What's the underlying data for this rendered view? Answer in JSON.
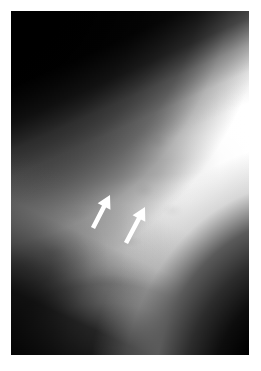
{
  "image": {
    "kind": "radiograph",
    "modality_label": "X-ray",
    "view_label": "Lateral chest radiograph",
    "caption": "",
    "border_color": "#ffffff",
    "plate": {
      "left": 11,
      "top": 11,
      "width": 238,
      "height": 344
    },
    "tones": {
      "background": "#ffffff",
      "air_black": "#000000",
      "soft_tissue_mid": "#9a9a9a",
      "overexposed_white": "#ffffff",
      "annotation": "#ffffff"
    },
    "regions": [
      {
        "name": "upper-left-air-field",
        "tone": "#000000",
        "description": "black wedge, upper left corner"
      },
      {
        "name": "right-overexposed-field",
        "tone": "#ffffff",
        "description": "bright white band along right side"
      },
      {
        "name": "mid-horizontal-band",
        "tone": "#4a4a4a",
        "description": "darker horizontal band across mid field"
      },
      {
        "name": "diaphragm-dome",
        "tone": "#e8e8e8",
        "description": "bright dome shaped structure, lower third"
      },
      {
        "name": "costophrenic-dark-pocket",
        "tone": "#1e1e1e",
        "description": "dark pocket at lower left"
      },
      {
        "name": "posterior-dark-band",
        "tone": "#000000",
        "description": "dark diagonal band at lower right"
      }
    ],
    "annotations": [
      {
        "name": "arrow-1",
        "type": "arrow",
        "color": "#ffffff",
        "points_to": "up-right",
        "tip_x": 110,
        "tip_y": 195,
        "tail_x": 93,
        "tail_y": 228
      },
      {
        "name": "arrow-2",
        "type": "arrow",
        "color": "#ffffff",
        "points_to": "up-right",
        "tip_x": 145,
        "tip_y": 207,
        "tail_x": 126,
        "tail_y": 243
      }
    ]
  }
}
